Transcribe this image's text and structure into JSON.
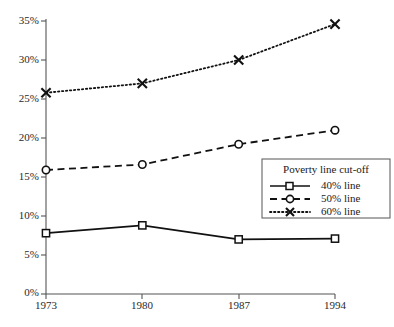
{
  "chart_data": {
    "type": "line",
    "title": "",
    "xlabel": "",
    "ylabel": "",
    "categories": [
      "1973",
      "1980",
      "1987",
      "1994"
    ],
    "x": [
      1973,
      1980,
      1987,
      1994
    ],
    "ylim": [
      0,
      35
    ],
    "xlim": [
      1973,
      1994
    ],
    "yticks": [
      0,
      5,
      10,
      15,
      20,
      25,
      30,
      35
    ],
    "ytick_labels": [
      "0%",
      "5%",
      "10%",
      "15%",
      "20%",
      "25%",
      "30%",
      "35%"
    ],
    "xtick_labels": [
      "1973",
      "1980",
      "1987",
      "1994"
    ],
    "grid": false,
    "legend_position": "lower-right-inside",
    "units": "percent",
    "series": [
      {
        "name": "40% line",
        "marker": "square",
        "linestyle": "solid",
        "color": "#111111",
        "values": [
          7.8,
          8.8,
          7.0,
          7.1
        ]
      },
      {
        "name": "50% line",
        "marker": "circle",
        "linestyle": "dashed",
        "color": "#111111",
        "values": [
          15.9,
          16.6,
          19.2,
          21.0
        ]
      },
      {
        "name": "60% line",
        "marker": "x",
        "linestyle": "dotted",
        "color": "#111111",
        "values": [
          25.8,
          27.0,
          30.0,
          34.6
        ]
      }
    ]
  },
  "legend": {
    "title": "Poverty line cut-off",
    "entries": [
      {
        "label": "40% line",
        "marker": "square",
        "linestyle": "solid"
      },
      {
        "label": "50% line",
        "marker": "circle",
        "linestyle": "dashed"
      },
      {
        "label": "60% line",
        "marker": "x",
        "linestyle": "dotted"
      }
    ]
  },
  "axis": {
    "y_labels": [
      "35%",
      "30%",
      "25%",
      "20%",
      "15%",
      "10%",
      "5%",
      "0%"
    ],
    "x_labels": [
      "1973",
      "1980",
      "1987",
      "1994"
    ]
  },
  "colors": {
    "ink": "#111111",
    "axis": "#555555",
    "background": "#ffffff"
  }
}
